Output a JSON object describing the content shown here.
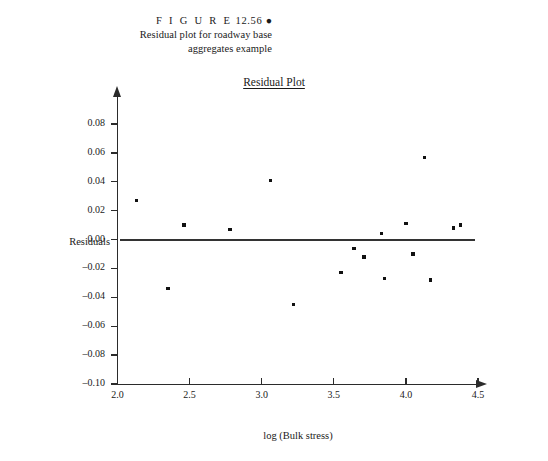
{
  "figure": {
    "label_word": "FIGURE",
    "label_spaced": "F I G U R E",
    "number": "12.56",
    "bullet": "●",
    "caption_line2": "Residual plot for roadway base",
    "caption_line3": "aggregates example"
  },
  "chart_data": {
    "type": "scatter",
    "title": "Residual Plot",
    "xlabel": "log (Bulk stress)",
    "ylabel": "Residuals",
    "xlim": [
      2.0,
      4.5
    ],
    "ylim": [
      -0.1,
      0.09
    ],
    "xticks": [
      "2.0",
      "2.5",
      "3.0",
      "3.5",
      "4.0",
      "4.5"
    ],
    "xtick_values": [
      2.0,
      2.5,
      3.0,
      3.5,
      4.0,
      4.5
    ],
    "yticks": [
      "0.08",
      "0.06",
      "0.04",
      "0.02",
      "0.00",
      "-0.02",
      "-0.04",
      "-0.06",
      "-0.08",
      "-0.10"
    ],
    "ytick_values": [
      0.08,
      0.06,
      0.04,
      0.02,
      0.0,
      -0.02,
      -0.04,
      -0.06,
      -0.08,
      -0.1
    ],
    "grid": false,
    "legend": "none",
    "reference_line": {
      "y": 0.0,
      "x_start": 2.02,
      "x_end": 4.48,
      "color": "#333333"
    },
    "marker_color": "#111111",
    "x": [
      2.13,
      2.35,
      2.46,
      2.78,
      3.06,
      3.22,
      3.55,
      3.64,
      3.71,
      3.83,
      3.85,
      4.0,
      4.05,
      4.13,
      4.17,
      4.33,
      4.38
    ],
    "y": [
      0.027,
      -0.034,
      0.01,
      0.007,
      0.041,
      -0.045,
      -0.023,
      -0.006,
      -0.012,
      0.004,
      -0.027,
      0.011,
      -0.01,
      0.057,
      -0.028,
      0.008,
      0.01
    ],
    "points": [
      {
        "x": 2.13,
        "y": 0.027
      },
      {
        "x": 2.35,
        "y": -0.034
      },
      {
        "x": 2.46,
        "y": 0.01
      },
      {
        "x": 2.78,
        "y": 0.007
      },
      {
        "x": 3.06,
        "y": 0.041
      },
      {
        "x": 3.22,
        "y": -0.045
      },
      {
        "x": 3.55,
        "y": -0.023
      },
      {
        "x": 3.64,
        "y": -0.006
      },
      {
        "x": 3.71,
        "y": -0.012
      },
      {
        "x": 3.83,
        "y": 0.004
      },
      {
        "x": 3.85,
        "y": -0.027
      },
      {
        "x": 4.0,
        "y": 0.011
      },
      {
        "x": 4.05,
        "y": -0.01
      },
      {
        "x": 4.13,
        "y": 0.057
      },
      {
        "x": 4.17,
        "y": -0.028
      },
      {
        "x": 4.33,
        "y": 0.008
      },
      {
        "x": 4.38,
        "y": 0.01
      }
    ]
  }
}
